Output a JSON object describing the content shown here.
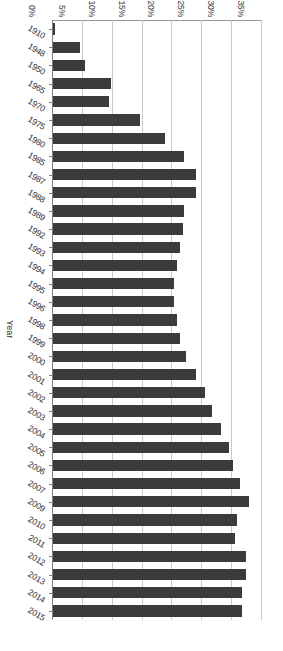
{
  "chart_data": {
    "type": "bar",
    "orientation": "vertical-rendered-rotated",
    "title": "",
    "subtitle": "",
    "xlabel": "Year",
    "ylabel": "",
    "ylim": [
      0,
      35
    ],
    "ytick_suffix": "%",
    "grid": true,
    "legend": null,
    "bar_color": "#3b3b3b",
    "gridline_color": "#c9c9c9",
    "axis_color": "#7f7f7f",
    "yticks": [
      "0%",
      "5%",
      "10%",
      "15%",
      "20%",
      "25%",
      "30%",
      "35%"
    ],
    "ytick_values": [
      0,
      5,
      10,
      15,
      20,
      25,
      30,
      35
    ],
    "categories": [
      "1910",
      "1948",
      "1950",
      "1965",
      "1970",
      "1975",
      "1980",
      "1985",
      "1987",
      "1988",
      "1989",
      "1992",
      "1993",
      "1994",
      "1995",
      "1996",
      "1998",
      "1999",
      "2000",
      "2001",
      "2002",
      "2003",
      "2004",
      "2005",
      "2006",
      "2007",
      "2009",
      "2010",
      "2011",
      "2012",
      "2013",
      "2014",
      "2015"
    ],
    "values": [
      0.3,
      4.5,
      5.4,
      9.7,
      9.4,
      14.6,
      18.7,
      22.0,
      23.9,
      23.9,
      22.0,
      21.7,
      21.2,
      20.7,
      20.2,
      20.2,
      20.7,
      21.2,
      22.3,
      23.9,
      25.5,
      26.7,
      28.2,
      29.4,
      30.1,
      31.4,
      32.8,
      30.8,
      30.4,
      32.3,
      32.3,
      31.6,
      31.6
    ],
    "series": [
      {
        "name": "",
        "values": [
          0.3,
          4.5,
          5.4,
          9.7,
          9.4,
          14.6,
          18.7,
          22.0,
          23.9,
          23.9,
          22.0,
          21.7,
          21.2,
          20.7,
          20.2,
          20.2,
          20.7,
          21.2,
          22.3,
          23.9,
          25.5,
          26.7,
          28.2,
          29.4,
          30.1,
          31.4,
          32.8,
          30.8,
          30.4,
          32.3,
          32.3,
          31.6,
          31.6
        ]
      }
    ]
  }
}
